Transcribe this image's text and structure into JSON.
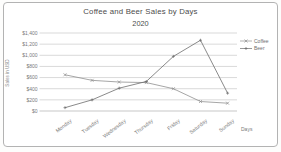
{
  "colors": {
    "grid": "#c9c9c9",
    "axis_text": "#7a7a7a",
    "title_text": "#4c4c4c",
    "border": "#b3b3b3",
    "coffee_line": "#8f8f8f",
    "beer_line": "#6c6c6c"
  },
  "chart_data": {
    "type": "line",
    "title": "Coffee and Beer Sales by Days",
    "subtitle": "2020",
    "xlabel": "Days",
    "ylabel": "Sales in USD",
    "categories": [
      "Monday",
      "Tuesday",
      "Wednesday",
      "Thursday",
      "Friday",
      "Saturday",
      "Sunday"
    ],
    "series": [
      {
        "name": "Coffee",
        "values": [
          650,
          550,
          520,
          510,
          400,
          170,
          140
        ],
        "color": "#8f8f8f",
        "marker": "x"
      },
      {
        "name": "Beer",
        "values": [
          60,
          200,
          410,
          530,
          980,
          1270,
          320
        ],
        "color": "#6c6c6c",
        "marker": "+"
      }
    ],
    "ylim": [
      0,
      1400
    ],
    "ytick_step": 200,
    "yticks": [
      "$0",
      "$200",
      "$400",
      "$600",
      "$800",
      "$1,000",
      "$1,200",
      "$1,400"
    ],
    "grid": true,
    "legend_position": "right"
  }
}
